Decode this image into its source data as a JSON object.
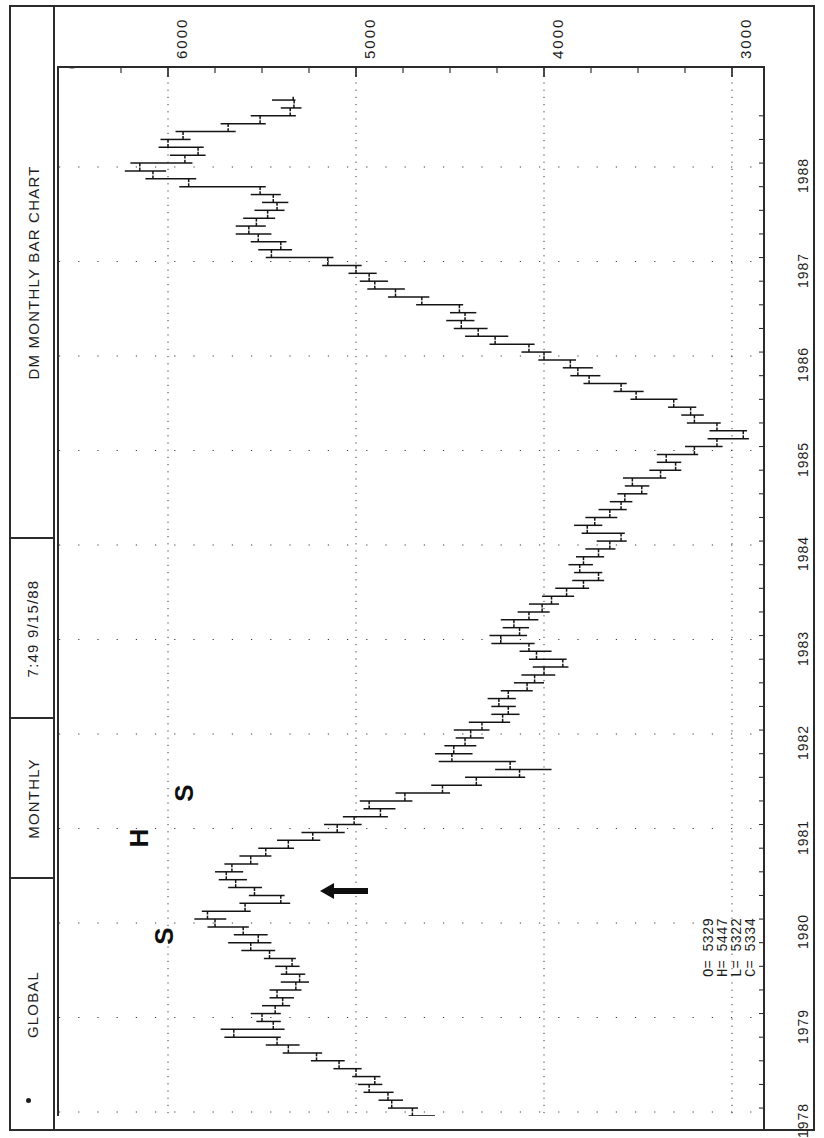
{
  "window": {
    "title": "DM MONTHLY BAR CHART",
    "header_cells": [
      {
        "name": "chart-title",
        "label": "DM MONTHLY BAR CHART"
      },
      {
        "name": "timestamp",
        "label": "7:49  9/15/88"
      },
      {
        "name": "period",
        "label": "MONTHLY"
      },
      {
        "name": "datasource",
        "label": "GLOBAL"
      }
    ]
  },
  "plot": {
    "origin_marker": "0",
    "corner_dot": "."
  },
  "quote": {
    "open_label": "O=",
    "high_label": "H=",
    "low_label": "L=",
    "close_label": "C=",
    "open": "5329",
    "high": "5447",
    "low": "5322",
    "close": "5334",
    "as_of_date": "9/ 1/88",
    "lines": [
      "O= 5329",
      "H= 5447",
      "L= 5322",
      "C= 5334"
    ]
  },
  "annotations": [
    {
      "name": "shoulder-left-label",
      "text": "S",
      "x": 162,
      "y": 936
    },
    {
      "name": "head-label",
      "text": "H",
      "x": 137,
      "y": 838
    },
    {
      "name": "shoulder-right-label",
      "text": "S",
      "x": 182,
      "y": 793
    },
    {
      "name": "neckline-arrow",
      "text": "←",
      "x": 340,
      "y": 888
    }
  ],
  "chart_data": {
    "type": "bar",
    "subtype": "ohlc-bar-chart",
    "orientation": "rotated-90-left",
    "title": "DM MONTHLY BAR CHART",
    "subtitle": "7:49  9/15/88  MONTHLY  GLOBAL",
    "xlabel": "Year",
    "ylabel": "Price",
    "grid": true,
    "legend": null,
    "price_axis": {
      "ticks": [
        6000,
        5000,
        4000,
        3000
      ],
      "tick_labels": [
        "6000",
        "5000",
        "4000",
        "3000"
      ],
      "range": [
        2650,
        6250
      ],
      "minor_tick_interval": 250
    },
    "time_axis": {
      "ticks": [
        1978,
        1979,
        1980,
        1981,
        1982,
        1983,
        1984,
        1985,
        1986,
        1987,
        1988
      ],
      "tick_labels": [
        "1978",
        "1979",
        "1980",
        "1981",
        "1982",
        "1983",
        "1984",
        "1985",
        "1986",
        "1987",
        "1988"
      ],
      "range": [
        "1977-07",
        "1988-09"
      ]
    },
    "last_bar": {
      "date": "9/ 1/88",
      "open": 5329,
      "high": 5447,
      "low": 5322,
      "close": 5334
    },
    "pattern": "head-and-shoulders (S-H-S) marked 1978-1981",
    "series": [
      {
        "name": "DM monthly OHLC",
        "fields": [
          "date",
          "open",
          "high",
          "low",
          "close"
        ],
        "values": [
          [
            "1977-07",
            4290,
            4380,
            4240,
            4350
          ],
          [
            "1977-08",
            4350,
            4410,
            4300,
            4390
          ],
          [
            "1977-09",
            4390,
            4450,
            4350,
            4430
          ],
          [
            "1977-10",
            4430,
            4540,
            4420,
            4520
          ],
          [
            "1977-11",
            4520,
            4620,
            4500,
            4600
          ],
          [
            "1977-12",
            4600,
            4720,
            4580,
            4700
          ],
          [
            "1978-01",
            4700,
            4830,
            4670,
            4810
          ],
          [
            "1978-02",
            4810,
            4880,
            4750,
            4830
          ],
          [
            "1978-03",
            4830,
            4960,
            4800,
            4930
          ],
          [
            "1978-04",
            4930,
            4990,
            4860,
            4900
          ],
          [
            "1978-05",
            4900,
            5020,
            4870,
            5000
          ],
          [
            "1978-06",
            5000,
            5120,
            4970,
            5090
          ],
          [
            "1978-07",
            5090,
            5240,
            5060,
            5210
          ],
          [
            "1978-08",
            5210,
            5390,
            5180,
            5360
          ],
          [
            "1978-09",
            5360,
            5480,
            5300,
            5420
          ],
          [
            "1978-10",
            5420,
            5700,
            5400,
            5650
          ],
          [
            "1978-11",
            5650,
            5720,
            5380,
            5440
          ],
          [
            "1978-12",
            5440,
            5530,
            5400,
            5500
          ],
          [
            "1979-01",
            5500,
            5560,
            5400,
            5430
          ],
          [
            "1979-02",
            5430,
            5500,
            5350,
            5390
          ],
          [
            "1979-03",
            5390,
            5460,
            5330,
            5420
          ],
          [
            "1979-04",
            5420,
            5460,
            5290,
            5320
          ],
          [
            "1979-05",
            5320,
            5400,
            5250,
            5300
          ],
          [
            "1979-06",
            5300,
            5400,
            5270,
            5370
          ],
          [
            "1979-07",
            5370,
            5430,
            5300,
            5340
          ],
          [
            "1979-08",
            5340,
            5490,
            5320,
            5460
          ],
          [
            "1979-09",
            5460,
            5610,
            5430,
            5560
          ],
          [
            "1979-10",
            5560,
            5680,
            5450,
            5520
          ],
          [
            "1979-11",
            5520,
            5650,
            5470,
            5600
          ],
          [
            "1979-12",
            5600,
            5790,
            5570,
            5750
          ],
          [
            "1980-01",
            5750,
            5860,
            5690,
            5790
          ],
          [
            "1980-02",
            5790,
            5820,
            5560,
            5590
          ],
          [
            "1980-03",
            5590,
            5620,
            5350,
            5400
          ],
          [
            "1980-04",
            5400,
            5570,
            5380,
            5540
          ],
          [
            "1980-05",
            5540,
            5680,
            5500,
            5640
          ],
          [
            "1980-06",
            5640,
            5730,
            5580,
            5690
          ],
          [
            "1980-07",
            5690,
            5750,
            5600,
            5660
          ],
          [
            "1980-08",
            5660,
            5700,
            5520,
            5560
          ],
          [
            "1980-09",
            5560,
            5620,
            5450,
            5480
          ],
          [
            "1980-10",
            5480,
            5520,
            5330,
            5360
          ],
          [
            "1980-11",
            5360,
            5420,
            5190,
            5230
          ],
          [
            "1980-12",
            5230,
            5290,
            5060,
            5100
          ],
          [
            "1981-01",
            5100,
            5170,
            4970,
            5010
          ],
          [
            "1981-02",
            5010,
            5070,
            4830,
            4870
          ],
          [
            "1981-03",
            4870,
            4960,
            4790,
            4930
          ],
          [
            "1981-04",
            4930,
            4980,
            4700,
            4740
          ],
          [
            "1981-05",
            4740,
            4790,
            4500,
            4540
          ],
          [
            "1981-06",
            4540,
            4600,
            4330,
            4360
          ],
          [
            "1981-07",
            4360,
            4420,
            4100,
            4130
          ],
          [
            "1981-08",
            4130,
            4260,
            3960,
            4180
          ],
          [
            "1981-09",
            4180,
            4560,
            4150,
            4490
          ],
          [
            "1981-10",
            4490,
            4580,
            4380,
            4480
          ],
          [
            "1981-11",
            4480,
            4530,
            4360,
            4420
          ],
          [
            "1981-12",
            4420,
            4470,
            4320,
            4390
          ],
          [
            "1982-01",
            4390,
            4480,
            4290,
            4330
          ],
          [
            "1982-02",
            4330,
            4400,
            4180,
            4220
          ],
          [
            "1982-03",
            4220,
            4280,
            4130,
            4190
          ],
          [
            "1982-04",
            4190,
            4280,
            4150,
            4240
          ],
          [
            "1982-05",
            4240,
            4300,
            4150,
            4190
          ],
          [
            "1982-06",
            4190,
            4230,
            4060,
            4090
          ],
          [
            "1982-07",
            4090,
            4160,
            4000,
            4050
          ],
          [
            "1982-08",
            4050,
            4120,
            3940,
            4000
          ],
          [
            "1982-09",
            4000,
            4060,
            3870,
            3900
          ],
          [
            "1982-10",
            3900,
            4080,
            3880,
            4040
          ],
          [
            "1982-11",
            4040,
            4130,
            3960,
            4080
          ],
          [
            "1982-12",
            4080,
            4280,
            4050,
            4230
          ],
          [
            "1983-01",
            4230,
            4290,
            4090,
            4130
          ],
          [
            "1983-02",
            4130,
            4220,
            4080,
            4160
          ],
          [
            "1983-03",
            4160,
            4230,
            4030,
            4080
          ],
          [
            "1983-04",
            4080,
            4140,
            3970,
            4010
          ],
          [
            "1983-05",
            4010,
            4080,
            3920,
            3960
          ],
          [
            "1983-06",
            3960,
            4010,
            3840,
            3880
          ],
          [
            "1983-07",
            3880,
            3940,
            3760,
            3790
          ],
          [
            "1983-08",
            3790,
            3850,
            3680,
            3710
          ],
          [
            "1983-09",
            3710,
            3840,
            3690,
            3810
          ],
          [
            "1983-10",
            3810,
            3870,
            3740,
            3790
          ],
          [
            "1983-11",
            3790,
            3830,
            3680,
            3710
          ],
          [
            "1983-12",
            3710,
            3780,
            3620,
            3650
          ],
          [
            "1984-01",
            3650,
            3720,
            3560,
            3590
          ],
          [
            "1984-02",
            3590,
            3800,
            3570,
            3770
          ],
          [
            "1984-03",
            3770,
            3840,
            3690,
            3730
          ],
          [
            "1984-04",
            3730,
            3780,
            3610,
            3650
          ],
          [
            "1984-05",
            3650,
            3710,
            3560,
            3590
          ],
          [
            "1984-06",
            3590,
            3650,
            3530,
            3570
          ],
          [
            "1984-07",
            3570,
            3610,
            3450,
            3480
          ],
          [
            "1984-08",
            3480,
            3570,
            3440,
            3530
          ],
          [
            "1984-09",
            3530,
            3580,
            3350,
            3380
          ],
          [
            "1984-10",
            3380,
            3440,
            3270,
            3300
          ],
          [
            "1984-11",
            3300,
            3400,
            3270,
            3350
          ],
          [
            "1984-12",
            3350,
            3400,
            3180,
            3200
          ],
          [
            "1985-01",
            3200,
            3250,
            3050,
            3080
          ],
          [
            "1985-02",
            3080,
            3130,
            2910,
            2940
          ],
          [
            "1985-03",
            2940,
            3120,
            2920,
            3080
          ],
          [
            "1985-04",
            3080,
            3240,
            3060,
            3200
          ],
          [
            "1985-05",
            3200,
            3270,
            3150,
            3220
          ],
          [
            "1985-06",
            3220,
            3340,
            3190,
            3310
          ],
          [
            "1985-07",
            3310,
            3540,
            3290,
            3510
          ],
          [
            "1985-08",
            3510,
            3630,
            3470,
            3590
          ],
          [
            "1985-09",
            3590,
            3790,
            3560,
            3760
          ],
          [
            "1985-10",
            3760,
            3860,
            3700,
            3820
          ],
          [
            "1985-11",
            3820,
            3900,
            3740,
            3860
          ],
          [
            "1985-12",
            3860,
            4030,
            3830,
            4000
          ],
          [
            "1986-01",
            4000,
            4120,
            3960,
            4080
          ],
          [
            "1986-02",
            4080,
            4290,
            4050,
            4260
          ],
          [
            "1986-03",
            4260,
            4420,
            4190,
            4350
          ],
          [
            "1986-04",
            4350,
            4480,
            4300,
            4440
          ],
          [
            "1986-05",
            4440,
            4520,
            4370,
            4420
          ],
          [
            "1986-06",
            4420,
            4500,
            4360,
            4450
          ],
          [
            "1986-07",
            4450,
            4680,
            4430,
            4650
          ],
          [
            "1986-08",
            4650,
            4830,
            4610,
            4790
          ],
          [
            "1986-09",
            4790,
            4940,
            4740,
            4900
          ],
          [
            "1986-10",
            4900,
            4980,
            4830,
            4930
          ],
          [
            "1986-11",
            4930,
            5040,
            4890,
            5000
          ],
          [
            "1986-12",
            5000,
            5180,
            4970,
            5150
          ],
          [
            "1987-01",
            5150,
            5480,
            5120,
            5450
          ],
          [
            "1987-02",
            5450,
            5520,
            5340,
            5400
          ],
          [
            "1987-03",
            5400,
            5560,
            5370,
            5520
          ],
          [
            "1987-04",
            5520,
            5640,
            5450,
            5570
          ],
          [
            "1987-05",
            5570,
            5640,
            5480,
            5530
          ],
          [
            "1987-06",
            5530,
            5600,
            5430,
            5470
          ],
          [
            "1987-07",
            5470,
            5540,
            5380,
            5420
          ],
          [
            "1987-08",
            5420,
            5500,
            5360,
            5440
          ],
          [
            "1987-09",
            5440,
            5560,
            5400,
            5510
          ],
          [
            "1987-10",
            5510,
            5940,
            5480,
            5890
          ],
          [
            "1987-11",
            5890,
            6120,
            5850,
            6080
          ],
          [
            "1987-12",
            6080,
            6230,
            6010,
            6150
          ],
          [
            "1988-01",
            6150,
            6200,
            5870,
            5910
          ],
          [
            "1988-02",
            5910,
            5990,
            5800,
            5840
          ],
          [
            "1988-03",
            5840,
            6050,
            5810,
            6000
          ],
          [
            "1988-04",
            6000,
            6040,
            5880,
            5920
          ],
          [
            "1988-05",
            5920,
            5960,
            5640,
            5680
          ],
          [
            "1988-06",
            5680,
            5720,
            5480,
            5510
          ],
          [
            "1988-07",
            5510,
            5560,
            5320,
            5350
          ],
          [
            "1988-08",
            5350,
            5400,
            5290,
            5330
          ],
          [
            "1988-09",
            5329,
            5447,
            5322,
            5334
          ]
        ]
      }
    ]
  }
}
